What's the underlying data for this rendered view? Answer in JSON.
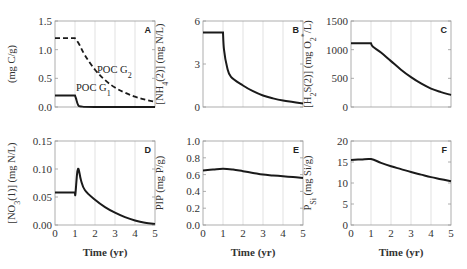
{
  "chart_data": [
    {
      "panel": "A",
      "type": "line",
      "xlabel": "",
      "ylabel": "(mg C/g)",
      "xlim": [
        0,
        5
      ],
      "ylim": [
        0,
        1.5
      ],
      "yticks": [
        "0.0",
        "0.5",
        "1.0",
        "1.5"
      ],
      "grid": true,
      "series": [
        {
          "name": "POC G2",
          "style": "dashed",
          "x": [
            0,
            1.0,
            1.2,
            1.5,
            2.0,
            2.5,
            3.0,
            3.5,
            4.0,
            4.5,
            5.0
          ],
          "values": [
            1.2,
            1.2,
            1.1,
            0.9,
            0.65,
            0.47,
            0.34,
            0.25,
            0.18,
            0.13,
            0.09
          ]
        },
        {
          "name": "POC G1",
          "style": "solid",
          "x": [
            0,
            1.0,
            1.05,
            1.15,
            1.3,
            2.0,
            5.0
          ],
          "values": [
            0.2,
            0.2,
            0.15,
            0.04,
            0.01,
            0.0,
            0.0
          ]
        }
      ],
      "annotations": [
        "POC G2",
        "POC G1"
      ]
    },
    {
      "panel": "B",
      "type": "line",
      "xlabel": "",
      "ylabel": "[NH4(2)] (mg N/L)",
      "xlim": [
        0,
        5
      ],
      "ylim": [
        0,
        6
      ],
      "yticks": [
        "0",
        "3",
        "6"
      ],
      "grid": true,
      "series": [
        {
          "name": "NH4(2)",
          "x": [
            0,
            1.0,
            1.05,
            1.2,
            1.4,
            2.0,
            2.5,
            3.0,
            3.5,
            4.0,
            4.5,
            5.0
          ],
          "values": [
            5.2,
            5.2,
            4.0,
            2.8,
            2.1,
            1.5,
            1.1,
            0.8,
            0.6,
            0.45,
            0.35,
            0.25
          ]
        }
      ]
    },
    {
      "panel": "C",
      "type": "line",
      "xlabel": "",
      "ylabel": "[H2S(2)] (mg O2*/L)",
      "xlim": [
        0,
        5
      ],
      "ylim": [
        0,
        1500
      ],
      "yticks": [
        "0",
        "500",
        "1000",
        "1500"
      ],
      "grid": true,
      "series": [
        {
          "name": "H2S(2)",
          "x": [
            0,
            1.0,
            1.1,
            1.5,
            2.0,
            2.5,
            3.0,
            3.5,
            4.0,
            4.5,
            5.0
          ],
          "values": [
            1110,
            1110,
            1050,
            950,
            800,
            650,
            520,
            410,
            320,
            260,
            210
          ]
        }
      ]
    },
    {
      "panel": "D",
      "type": "line",
      "xlabel": "Time (yr)",
      "ylabel": "[NO3(1)] (mg N/L)",
      "xlim": [
        0,
        5
      ],
      "ylim": [
        0,
        0.15
      ],
      "xticks": [
        "0",
        "1",
        "2",
        "3",
        "4",
        "5"
      ],
      "yticks": [
        "0.00",
        "0.05",
        "0.10",
        "0.15"
      ],
      "grid": true,
      "series": [
        {
          "name": "NO3(1)",
          "x": [
            0,
            1.0,
            1.02,
            1.1,
            1.15,
            1.2,
            1.3,
            1.5,
            2.0,
            2.5,
            3.0,
            3.5,
            4.0,
            4.5,
            5.0
          ],
          "values": [
            0.058,
            0.058,
            0.055,
            0.09,
            0.1,
            0.097,
            0.08,
            0.062,
            0.045,
            0.032,
            0.022,
            0.014,
            0.008,
            0.004,
            0.002
          ]
        }
      ]
    },
    {
      "panel": "E",
      "type": "line",
      "xlabel": "Time (yr)",
      "ylabel": "PIP (mg P/g)",
      "xlim": [
        0,
        5
      ],
      "ylim": [
        0,
        1.0
      ],
      "xticks": [
        "0",
        "1",
        "2",
        "3",
        "4",
        "5"
      ],
      "yticks": [
        "0.0",
        "0.2",
        "0.4",
        "0.6",
        "0.8",
        "1.0"
      ],
      "grid": true,
      "series": [
        {
          "name": "PIP",
          "x": [
            0,
            0.5,
            1.0,
            1.5,
            2.0,
            2.5,
            3.0,
            3.5,
            4.0,
            4.5,
            5.0
          ],
          "values": [
            0.65,
            0.66,
            0.67,
            0.66,
            0.64,
            0.62,
            0.6,
            0.59,
            0.58,
            0.57,
            0.56
          ]
        }
      ]
    },
    {
      "panel": "F",
      "type": "line",
      "xlabel": "Time (yr)",
      "ylabel": "PSi (mg Si/g)",
      "xlim": [
        0,
        5
      ],
      "ylim": [
        0,
        20
      ],
      "xticks": [
        "0",
        "1",
        "2",
        "3",
        "4",
        "5"
      ],
      "yticks": [
        "0",
        "5",
        "10",
        "15",
        "20"
      ],
      "grid": true,
      "series": [
        {
          "name": "PSi",
          "x": [
            0,
            0.5,
            1.0,
            1.5,
            2.0,
            2.5,
            3.0,
            3.5,
            4.0,
            4.5,
            5.0
          ],
          "values": [
            15.5,
            15.6,
            15.7,
            14.8,
            14.0,
            13.3,
            12.6,
            12.0,
            11.4,
            10.9,
            10.4
          ]
        }
      ]
    }
  ],
  "labels": {
    "A": {
      "letter": "A",
      "ylabel_main": "(mg C/g)",
      "annot_g2": "POC G",
      "annot_g2_sub": "2",
      "annot_g1": "POC G",
      "annot_g1_sub": "1"
    },
    "B": {
      "letter": "B",
      "ylabel_pre": "[NH",
      "ylabel_sub": "4",
      "ylabel_post": "(2)] (mg N/L)"
    },
    "C": {
      "letter": "C",
      "ylabel_pre": "[H",
      "ylabel_sub": "2",
      "ylabel_mid": "S(2)] (mg O",
      "ylabel_sub2": "2",
      "ylabel_sup": "*",
      "ylabel_post": "/L)"
    },
    "D": {
      "letter": "D",
      "ylabel_pre": "[NO",
      "ylabel_sub": "3",
      "ylabel_post": "(1)] (mg N/L)"
    },
    "E": {
      "letter": "E",
      "ylabel": "PIP (mg P/g)"
    },
    "F": {
      "letter": "F",
      "ylabel_pre": "P",
      "ylabel_sub": "Si",
      "ylabel_post": " (mg Si/g)"
    },
    "xlabel": "Time (yr)"
  }
}
